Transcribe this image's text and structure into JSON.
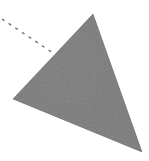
{
  "canvas": {
    "width": 149,
    "height": 161,
    "background_color": "#ffffff",
    "name": "shape-annotation-canvas"
  },
  "shapes": [
    {
      "id": "triangle",
      "kind": "polygon",
      "label": "triangle",
      "fill_color": "#7a7a7a",
      "fill_color_light": "#898989",
      "fill_color_dark": "#6d6d6d",
      "stroke_color": "#6f6f6f",
      "stroke_width": 0,
      "opacity": 1,
      "texture": "noise",
      "points": "93,14 13,99 142,152",
      "vertices": [
        {
          "name": "apex",
          "x": 93,
          "y": 14
        },
        {
          "name": "left",
          "x": 13,
          "y": 99
        },
        {
          "name": "bottom-right",
          "x": 142,
          "y": 152
        }
      ]
    }
  ],
  "annotations": [
    {
      "id": "dashed-guide",
      "kind": "line",
      "label": "dashed guide line",
      "stroke_color": "#5a5a5a",
      "stroke_width": 1.4,
      "dash_pattern": "3 5",
      "opacity": 0.85,
      "x1": 2,
      "y1": 19,
      "x2": 53,
      "y2": 53
    }
  ]
}
